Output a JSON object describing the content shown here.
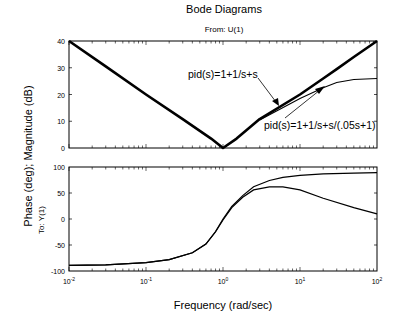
{
  "chart_data": [
    {
      "type": "line",
      "title": "Bode Diagrams",
      "subtitle": "From: U(1)",
      "panel": "magnitude",
      "xlabel": "Frequency (rad/sec)",
      "ylabel": "Phase (deg); Magnitude (dB)",
      "xscale": "log",
      "xlim": [
        0.01,
        100
      ],
      "ylim": [
        0,
        40
      ],
      "yticks": [
        0,
        10,
        20,
        30,
        40
      ],
      "grid": false,
      "x": [
        0.01,
        0.03,
        0.1,
        0.3,
        0.7,
        1,
        1.5,
        3,
        10,
        20,
        30,
        50,
        100
      ],
      "series": [
        {
          "name": "pid(s)=1+1/s+s",
          "values": [
            40,
            30.5,
            20,
            10.8,
            3.5,
            0,
            3.5,
            10.8,
            20,
            26,
            29.5,
            34,
            40
          ]
        },
        {
          "name": "pid(s)=1+1/s+s/(.05s+1)",
          "values": [
            40,
            30.5,
            20,
            10.8,
            3.5,
            0,
            3.4,
            10.5,
            18.5,
            22.5,
            24.5,
            25.6,
            26
          ]
        }
      ],
      "annotations": [
        {
          "text": "pid(s)=1+1/s+s",
          "arrow_to": "thick line near 8 rad/s"
        },
        {
          "text": "pid(s)=1+1/s+s/(.05s+1)",
          "arrow_to": "thin line near 20 rad/s"
        }
      ]
    },
    {
      "type": "line",
      "panel": "phase",
      "ylabel_side": "To: Y(1)",
      "xscale": "log",
      "xlim": [
        0.01,
        100
      ],
      "ylim": [
        -100,
        100
      ],
      "yticks": [
        -100,
        -50,
        0,
        50,
        100
      ],
      "xticks": [
        "10^-2",
        "10^-1",
        "10^0",
        "10^1",
        "10^2"
      ],
      "x": [
        0.01,
        0.03,
        0.1,
        0.2,
        0.4,
        0.6,
        0.8,
        1,
        1.3,
        1.8,
        2.5,
        4,
        6,
        10,
        20,
        50,
        100
      ],
      "series": [
        {
          "name": "pid(s)=1+1/s+s",
          "values": [
            -89,
            -88,
            -84,
            -78,
            -65,
            -48,
            -24,
            0,
            24,
            45,
            62,
            74,
            80,
            84,
            87,
            88,
            89
          ]
        },
        {
          "name": "pid(s)=1+1/s+s/(.05s+1)",
          "values": [
            -89,
            -88,
            -84,
            -78,
            -65,
            -48,
            -25,
            -2,
            22,
            42,
            56,
            62,
            62,
            56,
            40,
            22,
            10
          ]
        }
      ]
    }
  ],
  "labels": {
    "title": "Bode Diagrams",
    "from": "From: U(1)",
    "to": "To: Y(1)",
    "ylabel": "Phase (deg); Magnitude (dB)",
    "xlabel": "Frequency (rad/sec)",
    "ann1": "pid(s)=1+1/s+s",
    "ann2": "pid(s)=1+1/s+s/(.05s+1)",
    "mag_ticks": [
      "40",
      "30",
      "20",
      "10",
      "0"
    ],
    "phase_ticks": [
      "100",
      "50",
      "0",
      "-50",
      "-100"
    ],
    "x_tick_base": "10",
    "x_tick_exps": [
      "-2",
      "-1",
      "0",
      "1",
      "2"
    ]
  }
}
